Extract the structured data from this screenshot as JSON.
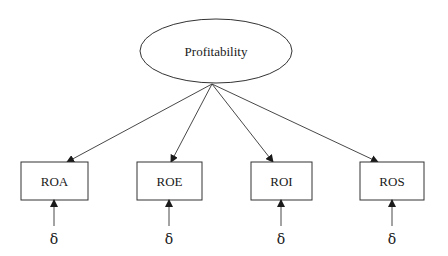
{
  "diagram": {
    "type": "measurement-model",
    "latent": {
      "label": "Profitability",
      "cx": 216,
      "cy": 51,
      "rx": 76,
      "ry": 32
    },
    "origin": {
      "x": 212,
      "y": 84
    },
    "indicators": [
      {
        "id": "roa",
        "label": "ROA",
        "x": 21,
        "y": 162,
        "w": 67,
        "h": 38,
        "arrow_tip_x": 67,
        "error_x": 54,
        "error_label": "δ"
      },
      {
        "id": "roe",
        "label": "ROE",
        "x": 137,
        "y": 162,
        "w": 65,
        "h": 38,
        "arrow_tip_x": 171,
        "error_x": 169,
        "error_label": "δ"
      },
      {
        "id": "roi",
        "label": "ROI",
        "x": 251,
        "y": 162,
        "w": 61,
        "h": 38,
        "arrow_tip_x": 273,
        "error_x": 281,
        "error_label": "δ"
      },
      {
        "id": "ros",
        "label": "ROS",
        "x": 360,
        "y": 162,
        "w": 64,
        "h": 38,
        "arrow_tip_x": 378,
        "error_x": 392,
        "error_label": "δ"
      }
    ],
    "error_arrow": {
      "y_start": 226,
      "y_end": 200,
      "label_y": 244
    },
    "colors": {
      "stroke": "#333333",
      "text": "#1a1a1a",
      "background": "#ffffff"
    }
  }
}
